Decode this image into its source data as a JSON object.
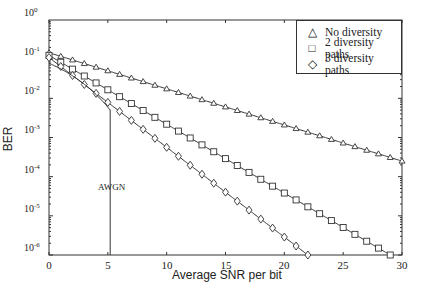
{
  "chart_data": {
    "type": "line",
    "title": "",
    "xlabel": "Average SNR per bit",
    "ylabel": "BER",
    "xlim": [
      0,
      30
    ],
    "ylim": [
      1e-06,
      1
    ],
    "yscale": "log",
    "xticks": [
      0,
      5,
      10,
      15,
      20,
      25,
      30
    ],
    "yticks": [
      "10^0",
      "10^-1",
      "10^-2",
      "10^-3",
      "10^-4",
      "10^-5",
      "10^-6"
    ],
    "grid": false,
    "legend_position": "upper right",
    "annotations": [
      {
        "text": "AWGN",
        "x": 4.2,
        "y": 0.0001
      }
    ],
    "series": [
      {
        "name": "No diversity",
        "marker": "triangle",
        "x_range": [
          0,
          30,
          1
        ],
        "start": 0.146,
        "end": 0.00025
      },
      {
        "name": "2 diversity paths",
        "marker": "square",
        "x_range": [
          0,
          29,
          1
        ],
        "start": 0.125,
        "end": 1e-06
      },
      {
        "name": "3 diversity paths",
        "marker": "diamond",
        "x_range": [
          0,
          22,
          1
        ],
        "start": 0.11,
        "end": 1e-06
      },
      {
        "name": "AWGN",
        "marker": "none",
        "x_range": [
          0,
          5.2
        ],
        "start": 0.079,
        "end": 1e-06
      }
    ]
  },
  "axes": {
    "xlabel": "Average SNR per bit",
    "ylabel": "BER",
    "xticks": [
      "0",
      "5",
      "10",
      "15",
      "20",
      "25",
      "30"
    ],
    "yticks": [
      {
        "base": "10",
        "exp": "0"
      },
      {
        "base": "10",
        "exp": "-1"
      },
      {
        "base": "10",
        "exp": "-2"
      },
      {
        "base": "10",
        "exp": "-3"
      },
      {
        "base": "10",
        "exp": "-4"
      },
      {
        "base": "10",
        "exp": "-5"
      },
      {
        "base": "10",
        "exp": "-6"
      }
    ]
  },
  "legend": {
    "items": [
      {
        "symbol": "△",
        "label": "No diversity"
      },
      {
        "symbol": "□",
        "label": "2 diversity paths"
      },
      {
        "symbol": "◇",
        "label": "3 diversity paths"
      }
    ]
  },
  "annotation": {
    "awgn": "AWGN"
  }
}
